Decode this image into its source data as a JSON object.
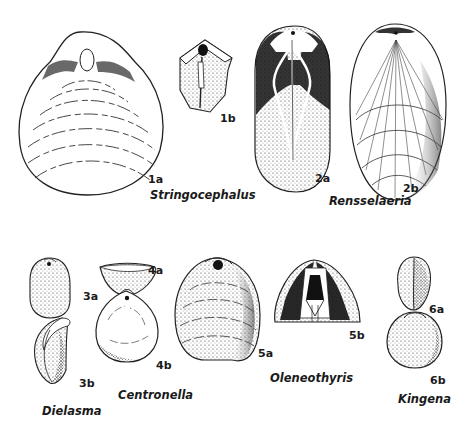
{
  "figure": {
    "panels": {
      "p1a": "1a",
      "p1b": "1b",
      "p2a": "2a",
      "p2b": "2b",
      "p3a": "3a",
      "p3b": "3b",
      "p4a": "4a",
      "p4b": "4b",
      "p5a": "5a",
      "p5b": "5b",
      "p6a": "6a",
      "p6b": "6b"
    },
    "genera": {
      "stringocephalus": "Stringocephalus",
      "rensselaeria": "Rensselaeria",
      "dielasma": "Dielasma",
      "centronella": "Centronella",
      "oleneothyris": "Oleneothyris",
      "kingena": "Kingena"
    }
  }
}
